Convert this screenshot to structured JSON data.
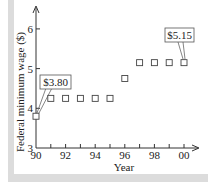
{
  "chart_data": {
    "type": "scatter",
    "title": "",
    "xlabel": "Year",
    "ylabel": "Federal minimum wage ($)",
    "x": [
      90,
      91,
      92,
      93,
      94,
      95,
      96,
      97,
      98,
      99,
      100
    ],
    "x_tick_labels": [
      "90",
      "92",
      "94",
      "96",
      "98",
      "00"
    ],
    "x_tick_values": [
      90,
      92,
      94,
      96,
      98,
      100
    ],
    "y_tick_labels": [
      "3",
      "4",
      "5",
      "6"
    ],
    "y_tick_values": [
      3,
      4,
      5,
      6
    ],
    "values": [
      3.8,
      4.25,
      4.25,
      4.25,
      4.25,
      4.25,
      4.75,
      5.15,
      5.15,
      5.15,
      5.15
    ],
    "xlim": [
      90,
      100
    ],
    "ylim": [
      3,
      6
    ],
    "grid": false,
    "marker": "open-square",
    "annotations": [
      {
        "text": "$3.80",
        "x": 90,
        "y": 3.8
      },
      {
        "text": "$5.15",
        "x": 100,
        "y": 5.15
      }
    ]
  },
  "axis": {
    "xlabel": "Year",
    "ylabel": "Federal minimum wage ($)"
  },
  "annotations": {
    "first": "$3.80",
    "last": "$5.15"
  }
}
